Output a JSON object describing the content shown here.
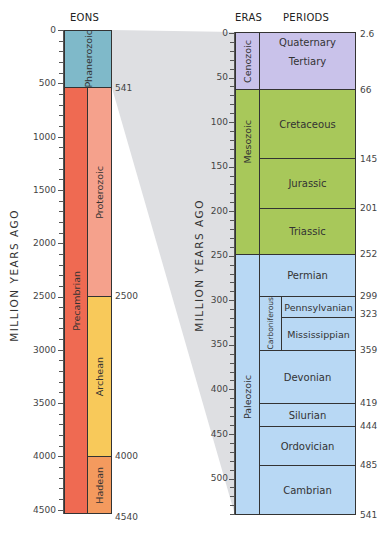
{
  "left_panel": {
    "header": "EONS",
    "axis_title": "MILLION YEARS AGO",
    "axis_ticks": [
      "0",
      "500",
      "1000",
      "1500",
      "2000",
      "2500",
      "3000",
      "3500",
      "4000",
      "4500"
    ],
    "boundary_labels": [
      "541",
      "2500",
      "4000",
      "4540"
    ],
    "super_eon": {
      "label": "Precambrian",
      "color": "#ef6a52"
    },
    "eons": [
      {
        "label": "Phanerozoic",
        "start": 0,
        "end": 541,
        "color": "#7fb9c9"
      },
      {
        "label": "Proterozoic",
        "start": 541,
        "end": 2500,
        "color": "#f5a18c"
      },
      {
        "label": "Archean",
        "start": 2500,
        "end": 4000,
        "color": "#f8c95a"
      },
      {
        "label": "Hadean",
        "start": 4000,
        "end": 4540,
        "color": "#f49a5e"
      }
    ]
  },
  "right_panel": {
    "header_eras": "ERAS",
    "header_periods": "PERIODS",
    "axis_title": "MILLION YEARS AGO",
    "axis_ticks": [
      "0",
      "50",
      "100",
      "150",
      "200",
      "250",
      "300",
      "350",
      "400",
      "450",
      "500"
    ],
    "boundary_labels": [
      "2.6",
      "66",
      "145",
      "201",
      "252",
      "299",
      "323",
      "359",
      "419",
      "444",
      "485",
      "541"
    ],
    "eras": [
      {
        "label": "Cenozoic",
        "start": 0,
        "end": 66,
        "color": "#c9c2ea"
      },
      {
        "label": "Mesozoic",
        "start": 66,
        "end": 252,
        "color": "#a8c85a"
      },
      {
        "label": "Paleozoic",
        "start": 252,
        "end": 541,
        "color": "#b8d8f4"
      }
    ],
    "periods": [
      {
        "label": "Quaternary",
        "start": 0,
        "end": 2.6
      },
      {
        "label": "Tertiary",
        "start": 2.6,
        "end": 66
      },
      {
        "label": "Cretaceous",
        "start": 66,
        "end": 145
      },
      {
        "label": "Jurassic",
        "start": 145,
        "end": 201
      },
      {
        "label": "Triassic",
        "start": 201,
        "end": 252
      },
      {
        "label": "Permian",
        "start": 252,
        "end": 299
      },
      {
        "label": "Pennsylvanian",
        "start": 299,
        "end": 323
      },
      {
        "label": "Mississippian",
        "start": 323,
        "end": 359
      },
      {
        "label": "Devonian",
        "start": 359,
        "end": 419
      },
      {
        "label": "Silurian",
        "start": 419,
        "end": 444
      },
      {
        "label": "Ordovician",
        "start": 444,
        "end": 485
      },
      {
        "label": "Cambrian",
        "start": 485,
        "end": 541
      }
    ],
    "grouped_period": {
      "label": "Carboniferous",
      "start": 299,
      "end": 359
    }
  },
  "connector": {
    "color": "#dcdde0",
    "from_label": "541"
  }
}
